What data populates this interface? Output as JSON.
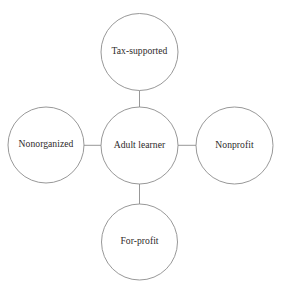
{
  "diagram": {
    "type": "hub-and-spoke",
    "background_color": "#ffffff",
    "stroke_color": "#8c8c8c",
    "text_color": "#2e2a2a",
    "center": {
      "id": "adult-learner",
      "label": "Adult learner",
      "cx": 139.5,
      "cy": 145.5,
      "r": 38.5
    },
    "satellites": [
      {
        "id": "tax-supported",
        "label": "Tax-supported",
        "position": "top",
        "cx": 139.5,
        "cy": 52.0,
        "r": 38.5
      },
      {
        "id": "nonorganized",
        "label": "Nonorganized",
        "position": "left",
        "cx": 46.0,
        "cy": 145.0,
        "r": 38.0
      },
      {
        "id": "nonprofit",
        "label": "Nonprofit",
        "position": "right",
        "cx": 234.5,
        "cy": 145.5,
        "r": 38.5
      },
      {
        "id": "for-profit",
        "label": "For-profit",
        "position": "bottom",
        "cx": 139.5,
        "cy": 242.0,
        "r": 38.0
      }
    ],
    "connectors": [
      {
        "id": "center-to-tax-supported",
        "from": "adult-learner",
        "to": "tax-supported",
        "x1": 139.5,
        "y1": 107.0,
        "x2": 139.5,
        "y2": 90.5
      },
      {
        "id": "center-to-nonorganized",
        "from": "adult-learner",
        "to": "nonorganized",
        "x1": 101.0,
        "y1": 145.3,
        "x2": 84.0,
        "y2": 145.3
      },
      {
        "id": "center-to-nonprofit",
        "from": "adult-learner",
        "to": "nonprofit",
        "x1": 178.0,
        "y1": 145.3,
        "x2": 196.0,
        "y2": 145.3
      },
      {
        "id": "center-to-for-profit",
        "from": "adult-learner",
        "to": "for-profit",
        "x1": 139.5,
        "y1": 184.0,
        "x2": 139.5,
        "y2": 204.0
      }
    ]
  }
}
